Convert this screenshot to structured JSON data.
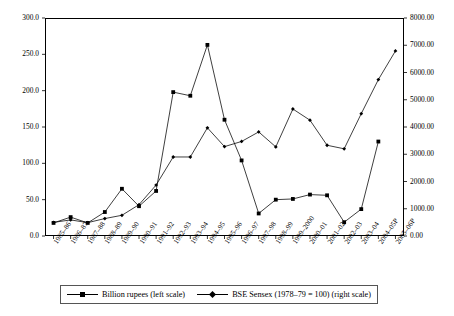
{
  "chart_data": {
    "type": "line",
    "title": "",
    "xlabel": "",
    "ylabel": "Billion rupees",
    "ylabel_right": "BSE Sensex (1978–79 = 100)",
    "grid": false,
    "legend_position": "bottom",
    "ylim": [
      0,
      300
    ],
    "ylim_right": [
      0,
      8000
    ],
    "yticks": [
      "0.0",
      "50.0",
      "100.0",
      "150.0",
      "200.0",
      "250.0",
      "300.0"
    ],
    "ytick_values": [
      0,
      50,
      100,
      150,
      200,
      250,
      300
    ],
    "yticks_right": [
      "0.00",
      "1000.00",
      "2000.00",
      "3000.00",
      "4000.00",
      "5000.00",
      "6000.00",
      "7000.00",
      "8000.00"
    ],
    "ytick_values_right": [
      0,
      1000,
      2000,
      3000,
      4000,
      5000,
      6000,
      7000,
      8000
    ],
    "categories": [
      "1985–86",
      "1986–87",
      "1987–88",
      "1988–89",
      "1989–90",
      "1990–91",
      "1991–92",
      "1992–93",
      "1993–94",
      "1994–95",
      "1995–96",
      "1996–97",
      "1997–98",
      "1998–99",
      "1999–2000",
      "2000–01",
      "2001–02",
      "2002–03",
      "2003–04",
      "2004–05P",
      "2005–06P"
    ],
    "series": [
      {
        "name": "Billion rupees (left scale)",
        "axis": "left",
        "marker": "square",
        "values": [
          18,
          26,
          18,
          33,
          65,
          41,
          62,
          198,
          193,
          263,
          160,
          104,
          31,
          50,
          51,
          57,
          56,
          19,
          37,
          130,
          null
        ]
      },
      {
        "name": "BSE Sensex (1978–79 = 100) (right scale)",
        "axis": "right",
        "marker": "diamond",
        "values": [
          500,
          590,
          490,
          640,
          760,
          1150,
          1870,
          2900,
          2900,
          3970,
          3280,
          3470,
          3820,
          3270,
          4660,
          4250,
          3330,
          3200,
          4490,
          5740,
          6790
        ]
      }
    ],
    "legend": [
      {
        "label": "Billion rupees (left scale)",
        "marker": "square"
      },
      {
        "label": "BSE Sensex (1978–79 = 100) (right scale)",
        "marker": "diamond"
      }
    ]
  }
}
